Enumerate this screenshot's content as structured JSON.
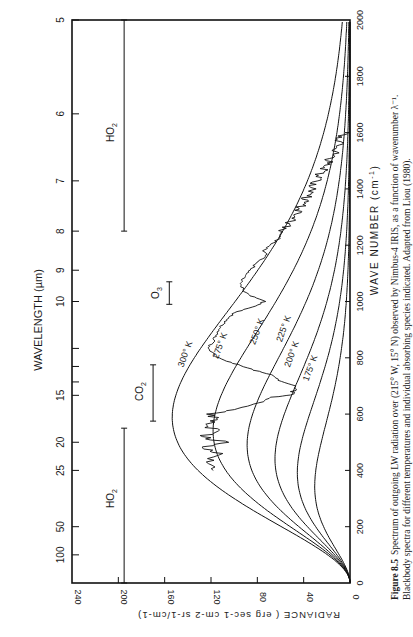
{
  "chart_data": {
    "type": "line",
    "title": "",
    "xlabel": "WAVE NUMBER (cm-1)",
    "ylabel": "RADIANCE (erg sec-1 cm-2 sr-1/cm-1)",
    "top_axis_label": "WAVELENGTH (µm)",
    "xlim": [
      0,
      2000
    ],
    "ylim": [
      0,
      240
    ],
    "x_ticks": [
      0,
      200,
      400,
      600,
      800,
      1000,
      1200,
      1400,
      1600,
      1800,
      2000
    ],
    "y_ticks": [
      0,
      40,
      80,
      120,
      160,
      200,
      240
    ],
    "wavelength_ticks": [
      {
        "label": "5",
        "um": 5
      },
      {
        "label": "6",
        "um": 6
      },
      {
        "label": "7",
        "um": 7
      },
      {
        "label": "8",
        "um": 8
      },
      {
        "label": "9",
        "um": 9
      },
      {
        "label": "10",
        "um": 10
      },
      {
        "label": "",
        "um": 12
      },
      {
        "label": "",
        "um": 13
      },
      {
        "label": "",
        "um": 14
      },
      {
        "label": "15",
        "um": 15
      },
      {
        "label": "20",
        "um": 20
      },
      {
        "label": "25",
        "um": 25
      },
      {
        "label": "50",
        "um": 50
      },
      {
        "label": "100",
        "um": 100
      }
    ],
    "grid": false,
    "series": [
      {
        "name": "300° K",
        "type": "blackbody",
        "T": 300,
        "label_at": [
          810,
          140
        ]
      },
      {
        "name": "275° K",
        "type": "blackbody",
        "T": 275,
        "label_at": [
          840,
          110
        ]
      },
      {
        "name": "250° K",
        "type": "blackbody",
        "T": 250,
        "label_at": [
          890,
          78
        ]
      },
      {
        "name": "225° K",
        "type": "blackbody",
        "T": 225,
        "label_at": [
          900,
          55
        ]
      },
      {
        "name": "200° K",
        "type": "blackbody",
        "T": 200,
        "label_at": [
          810,
          48
        ]
      },
      {
        "name": "175° K",
        "type": "blackbody",
        "T": 175,
        "label_at": [
          760,
          32
        ]
      },
      {
        "name": "Observed (Nimbus-4 IRIS)",
        "type": "observed",
        "x": [
          400,
          430,
          460,
          480,
          500,
          520,
          540,
          560,
          580,
          600,
          620,
          640,
          660,
          670,
          680,
          700,
          720,
          740,
          760,
          780,
          800,
          820,
          840,
          860,
          880,
          900,
          920,
          940,
          960,
          980,
          1000,
          1020,
          1040,
          1060,
          1080,
          1100,
          1120,
          1140,
          1160,
          1180,
          1200,
          1220,
          1240,
          1260,
          1280,
          1300,
          1320,
          1340,
          1360,
          1380,
          1400,
          1420,
          1440,
          1460,
          1480,
          1500,
          1520,
          1540,
          1560,
          1580,
          1600
        ],
        "y": [
          118,
          124,
          112,
          130,
          108,
          128,
          112,
          126,
          116,
          120,
          96,
          80,
          66,
          48,
          50,
          44,
          62,
          68,
          86,
          100,
          114,
          120,
          122,
          118,
          116,
          114,
          110,
          106,
          100,
          84,
          74,
          86,
          92,
          94,
          92,
          88,
          84,
          80,
          72,
          74,
          70,
          62,
          60,
          56,
          52,
          50,
          46,
          42,
          40,
          36,
          32,
          30,
          28,
          24,
          20,
          18,
          14,
          12,
          10,
          8,
          5
        ]
      }
    ],
    "annotations": [
      {
        "text": "H2O",
        "band_cm": [
          0,
          550
        ],
        "radiance": 195,
        "label_cm": 300
      },
      {
        "text": "CO2",
        "band_cm": [
          575,
          775
        ],
        "radiance": 170,
        "label_cm": 680
      },
      {
        "text": "O3",
        "band_cm": [
          990,
          1070
        ],
        "radiance": 156,
        "label_cm": 1030
      },
      {
        "text": "H2O",
        "band_cm": [
          1250,
          2000
        ],
        "radiance": 195,
        "label_cm": 1600
      }
    ]
  },
  "labels": {
    "wavelength_axis": "WAVELENGTH (µm)",
    "wavenumber_axis": "WAVE NUMBER (cm",
    "wavenumber_sup": "-1",
    "radiance_axis": "RADIANCE ( erg sec-1 cm-2 sr-1/cm-1)",
    "t300": "300° K",
    "t275": "275° K",
    "t250": "250° K",
    "t225": "225° K",
    "t200": "200° K",
    "t175": "175° K",
    "h2o": "H2O",
    "co2": "CO2",
    "o3": "O3"
  },
  "caption": {
    "figure_label": "Figure 8.5",
    "line1": "Spectrum of outgoing LW radiation over (215° W, 15° N) observed by Nimbus-4 IRIS, as a function of wavenumber λ⁻¹.",
    "line2": "Blackbody spectra for different temperatures and individual absorbing species indicated. Adapted from Liou (1980)."
  }
}
